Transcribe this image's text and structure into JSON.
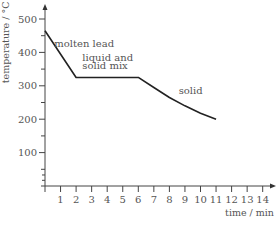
{
  "chart_data": {
    "type": "line",
    "title": "",
    "xlabel": "time / min",
    "ylabel": "temperature / °C",
    "xlim": [
      0,
      14.5
    ],
    "ylim": [
      0,
      530
    ],
    "x_ticks": [
      0,
      1,
      2,
      3,
      4,
      5,
      6,
      7,
      8,
      9,
      10,
      11,
      12,
      13,
      14
    ],
    "x_tick_labels": [
      "1",
      "2",
      "3",
      "4",
      "5",
      "6",
      "7",
      "8",
      "9",
      "10",
      "11",
      "12",
      "13",
      "14"
    ],
    "y_ticks": [
      100,
      200,
      300,
      400,
      500
    ],
    "y_tick_labels": [
      "100",
      "200",
      "300",
      "400",
      "500"
    ],
    "grid": false,
    "series": [
      {
        "name": "cooling curve of lead",
        "points": [
          [
            0,
            465
          ],
          [
            2,
            325
          ],
          [
            6,
            325
          ],
          [
            7,
            295
          ],
          [
            8,
            265
          ],
          [
            9,
            240
          ],
          [
            10,
            218
          ],
          [
            11,
            200
          ]
        ]
      }
    ],
    "annotations": [
      {
        "text": "molten lead",
        "x": 0.6,
        "y": 415
      },
      {
        "text": "liquid and",
        "x": 2.4,
        "y": 375
      },
      {
        "text": "solid mix",
        "x": 2.4,
        "y": 350
      },
      {
        "text": "solid",
        "x": 8.6,
        "y": 275
      }
    ]
  }
}
